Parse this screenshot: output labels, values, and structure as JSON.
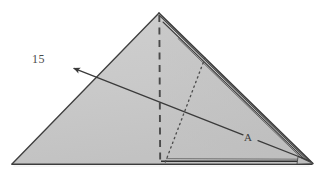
{
  "figure": {
    "kind": "origami-fold-diagram",
    "step_number": "15",
    "point_label": "A",
    "background_color": "#ffffff",
    "paper_fill_color": "#c8c8c8",
    "paper_fill_color_light": "#d2d2d2",
    "edge_color": "#3a3a3a",
    "crease_color": "#4a4a4a",
    "arrow_color": "#3a3a3a",
    "layer_edge_color": "#2e2e2e",
    "shape": {
      "apex": [
        159,
        13
      ],
      "bottom_left": [
        12,
        164
      ],
      "bottom_right": [
        312,
        163
      ]
    },
    "annotations": {
      "valley_fold_dashed": {
        "name": "vertical-dashed-crease",
        "from": [
          159,
          14
        ],
        "to": [
          160,
          164
        ]
      },
      "hidden_edge_dotted": {
        "name": "hidden-edge-dotted-line",
        "from": [
          205,
          58
        ],
        "to": [
          165,
          163
        ]
      },
      "fold_arrow": {
        "name": "fold-direction-arrow",
        "from": [
          310,
          161
        ],
        "to": [
          73,
          68
        ]
      }
    },
    "layer_edges_count": 3
  },
  "labels": {
    "step": "15",
    "point_a": "A"
  }
}
